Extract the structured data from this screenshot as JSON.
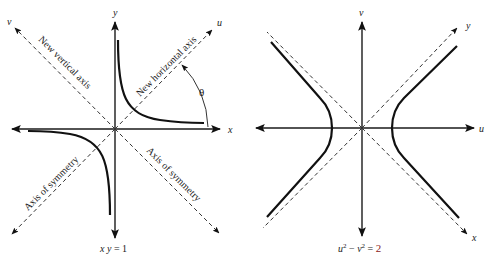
{
  "left_panel": {
    "axes": {
      "x": "x",
      "y": "y",
      "u": "u",
      "v": "v"
    },
    "labels": {
      "new_vertical_axis": "New vertical axis",
      "new_horizontal_axis": "New horizontal axis",
      "axis_of_symmetry_left": "Axis of symmetry",
      "axis_of_symmetry_right": "Axis of symmetry",
      "angle": "θ"
    },
    "caption": {
      "lhs": "x y",
      "eq": " = 1"
    }
  },
  "right_panel": {
    "axes": {
      "u": "u",
      "v": "v",
      "x": "x",
      "y": "y"
    },
    "caption": {
      "u": "u",
      "u_exp": "2",
      "minus": " − ",
      "v": "v",
      "v_exp": "2",
      "eq": " = ",
      "rhs": "2"
    },
    "colors": {
      "rhs": "#8b1a1a"
    }
  }
}
